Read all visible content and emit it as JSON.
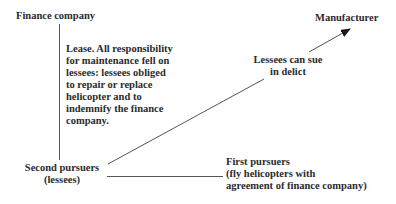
{
  "diagram": {
    "nodes": {
      "finance_company": {
        "label": "Finance company"
      },
      "manufacturer": {
        "label": "Manufacturer"
      },
      "second_pursuers": {
        "lines": [
          "Second pursuers",
          "(lessees)"
        ]
      },
      "first_pursuers": {
        "lines": [
          "First pursuers",
          "(fly helicopters with",
          "agreement of finance company)"
        ]
      }
    },
    "edges": {
      "lease": {
        "from": "finance_company",
        "to": "second_pursuers",
        "lines": [
          "Lease. All responsibility",
          "for maintenance fell on",
          "lessees: lessees obliged",
          "to repair or replace",
          "helicopter and to",
          "indemnify the finance",
          "company."
        ]
      },
      "delict": {
        "from": "second_pursuers",
        "to": "manufacturer",
        "lines": [
          "Lessees can sue",
          "in delict"
        ]
      },
      "first_link": {
        "from": "second_pursuers",
        "to": "first_pursuers"
      }
    },
    "colors": {
      "text": "#2b2b2b",
      "line": "#555555",
      "background": "#ffffff"
    }
  }
}
